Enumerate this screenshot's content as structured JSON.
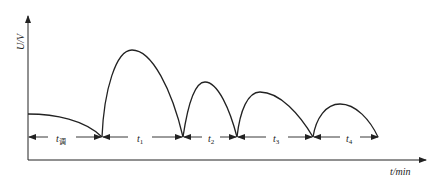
{
  "diagram": {
    "y_axis_label": "U/V",
    "x_axis_label": "t/min",
    "intervals": [
      {
        "id": "t_tiao",
        "label": "t",
        "sub": "调"
      },
      {
        "id": "t1",
        "label": "t",
        "sub": "1"
      },
      {
        "id": "t2",
        "label": "t",
        "sub": "2"
      },
      {
        "id": "t3",
        "label": "t",
        "sub": "3"
      },
      {
        "id": "t4",
        "label": "t",
        "sub": "4"
      }
    ],
    "line_color": "#222222"
  }
}
